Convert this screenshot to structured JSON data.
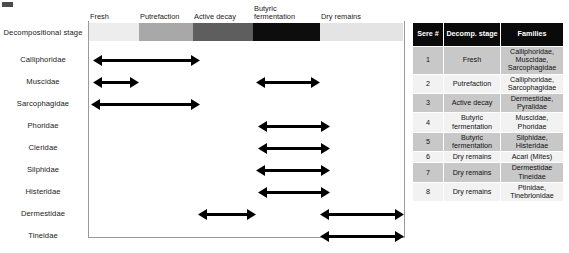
{
  "figure": {
    "row_axis_title": "Decompositional stage",
    "stage_bar": {
      "segments": [
        {
          "label": "Fresh",
          "color": "#ededed",
          "left": 0,
          "width": 50
        },
        {
          "label": "Putrefaction",
          "color": "#a8a8a8",
          "left": 50,
          "width": 54
        },
        {
          "label": "Active decay",
          "color": "#5e5e5e",
          "left": 104,
          "width": 60
        },
        {
          "label": "Butyric\nfermentation",
          "color": "#0d0d0d",
          "left": 164,
          "width": 67
        },
        {
          "label": "Dry remains",
          "color": "#e4e4e4",
          "left": 231,
          "width": 83
        }
      ]
    },
    "taxa_rows": [
      {
        "label": "Calliphoridae",
        "arrows": [
          {
            "x1": 93,
            "x2": 200
          }
        ]
      },
      {
        "label": "Muscidae",
        "arrows": [
          {
            "x1": 93,
            "x2": 139
          },
          {
            "x1": 256,
            "x2": 320
          }
        ]
      },
      {
        "label": "Sarcophagidae",
        "arrows": [
          {
            "x1": 91,
            "x2": 200
          }
        ]
      },
      {
        "label": "Phoridae",
        "arrows": [
          {
            "x1": 258,
            "x2": 330
          }
        ]
      },
      {
        "label": "Cleridae",
        "arrows": [
          {
            "x1": 258,
            "x2": 330
          }
        ]
      },
      {
        "label": "Silphidae",
        "arrows": [
          {
            "x1": 256,
            "x2": 330
          }
        ]
      },
      {
        "label": "Histeridae",
        "arrows": [
          {
            "x1": 258,
            "x2": 330
          }
        ]
      },
      {
        "label": "Dermestidae",
        "arrows": [
          {
            "x1": 198,
            "x2": 256
          },
          {
            "x1": 320,
            "x2": 404
          }
        ]
      },
      {
        "label": "Tineidae",
        "arrows": [
          {
            "x1": 320,
            "x2": 404
          }
        ]
      }
    ],
    "arrow_color": "#000000"
  },
  "table": {
    "headers": [
      "Sere #",
      "Decomp. stage",
      "Families"
    ],
    "rows": [
      {
        "sere": "1",
        "stage": "Fresh",
        "families": "Calliphoridae, Muscidae, Sarcophagidae"
      },
      {
        "sere": "2",
        "stage": "Putrefaction",
        "families": "Calliphoridae, Sarcophagidae"
      },
      {
        "sere": "3",
        "stage": "Active decay",
        "families": "Dermestidae, Pyralidae"
      },
      {
        "sere": "4",
        "stage": "Butyric fermentation",
        "families": "Muscidae, Phoridae"
      },
      {
        "sere": "5",
        "stage": "Butyric fermentation",
        "families": "Silphidae, Histeridae"
      },
      {
        "sere": "6",
        "stage": "Dry remains",
        "families": "Acari (Mites)"
      },
      {
        "sere": "7",
        "stage": "Dry remains",
        "families": "Dermestidae Tineidae"
      },
      {
        "sere": "8",
        "stage": "Dry remains",
        "families": "Ptinidae, Tinebrionidae"
      }
    ],
    "header_bg": "#0a0a0a",
    "shade_bg": "#c8c8c8",
    "plain_bg": "#f2f2f2"
  },
  "chart_data": {
    "type": "table",
    "xlabel": "Decompositional stage",
    "ylabel": "Family",
    "categories": [
      "Fresh",
      "Putrefaction",
      "Active decay",
      "Butyric fermentation",
      "Dry remains"
    ],
    "series": [
      {
        "name": "Calliphoridae",
        "stages": [
          "Fresh",
          "Putrefaction",
          "Active decay"
        ]
      },
      {
        "name": "Muscidae",
        "stages": [
          "Fresh",
          "Butyric fermentation"
        ]
      },
      {
        "name": "Sarcophagidae",
        "stages": [
          "Fresh",
          "Putrefaction",
          "Active decay"
        ]
      },
      {
        "name": "Phoridae",
        "stages": [
          "Butyric fermentation"
        ]
      },
      {
        "name": "Cleridae",
        "stages": [
          "Butyric fermentation"
        ]
      },
      {
        "name": "Silphidae",
        "stages": [
          "Butyric fermentation"
        ]
      },
      {
        "name": "Histeridae",
        "stages": [
          "Butyric fermentation"
        ]
      },
      {
        "name": "Dermestidae",
        "stages": [
          "Active decay",
          "Dry remains"
        ]
      },
      {
        "name": "Tineidae",
        "stages": [
          "Dry remains"
        ]
      }
    ],
    "legend": "none",
    "grid": false
  }
}
